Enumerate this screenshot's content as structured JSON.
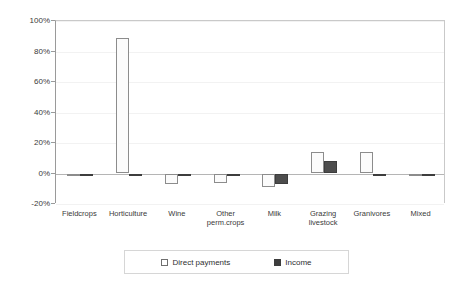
{
  "chart_data": {
    "type": "bar",
    "title": "",
    "xlabel": "",
    "ylabel": "",
    "ylim": [
      -20,
      100
    ],
    "ytick_values": [
      100,
      80,
      60,
      40,
      20,
      0,
      -20
    ],
    "ytick_labels": [
      "100%",
      "80%",
      "60%",
      "40%",
      "20%",
      "0%",
      "-20%"
    ],
    "grid": false,
    "legend_position": "bottom",
    "categories": [
      "Fieldcrops",
      "Horticulture",
      "Wine",
      "Other perm.crops",
      "Milk",
      "Grazing livestock",
      "Granivores",
      "Mixed"
    ],
    "category_lines": [
      [
        "Fieldcrops",
        ""
      ],
      [
        "Horticulture",
        ""
      ],
      [
        "Wine",
        ""
      ],
      [
        "Other",
        "perm.crops"
      ],
      [
        "Milk",
        ""
      ],
      [
        "Grazing",
        "livestock"
      ],
      [
        "Granivores",
        ""
      ],
      [
        "Mixed",
        ""
      ]
    ],
    "series": [
      {
        "name": "Direct payments",
        "color": "#fbfbfb",
        "values": [
          -1,
          89,
          -7,
          -6,
          -9,
          14,
          14,
          0
        ]
      },
      {
        "name": "Income",
        "color": "#4d4d4d",
        "values": [
          -1,
          -1,
          0,
          -1,
          -7,
          8,
          -1,
          0
        ]
      }
    ]
  },
  "legend": {
    "items": [
      {
        "label": "Direct payments",
        "swatch": "direct"
      },
      {
        "label": "Income",
        "swatch": "income"
      }
    ]
  }
}
